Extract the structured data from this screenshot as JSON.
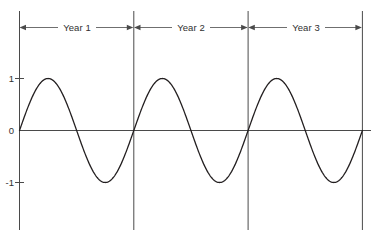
{
  "chart_data": {
    "type": "line",
    "title": "",
    "subtitle": "",
    "xlabel": "",
    "ylabel": "",
    "xlim": [
      0,
      3
    ],
    "ylim": [
      -1.35,
      1.35
    ],
    "grid": false,
    "legend": null,
    "x_tick_labels": [],
    "y_ticks": [
      1,
      0,
      -1
    ],
    "y_tick_labels": [
      "1",
      "0",
      "-1"
    ],
    "series": [
      {
        "name": "sine wave",
        "description": "y = sin(2*pi*x), three full cycles over three years",
        "color": "#231f20",
        "line_width": 1.3,
        "cycles": 3,
        "amplitude": 1,
        "period_years": 1,
        "x": [
          0,
          0.25,
          0.5,
          0.75,
          1,
          1.25,
          1.5,
          1.75,
          2,
          2.25,
          2.5,
          2.75,
          3
        ],
        "values": [
          0,
          1,
          0,
          -1,
          0,
          1,
          0,
          -1,
          0,
          1,
          0,
          -1,
          0
        ]
      }
    ],
    "annotations": [
      {
        "label": "Year 1",
        "x_start": 0,
        "x_end": 1,
        "style": "double-headed-arrow"
      },
      {
        "label": "Year 2",
        "x_start": 1,
        "x_end": 2,
        "style": "double-headed-arrow"
      },
      {
        "label": "Year 3",
        "x_start": 2,
        "x_end": 3,
        "style": "double-headed-arrow"
      }
    ],
    "dividers": [
      {
        "x": 0
      },
      {
        "x": 1
      },
      {
        "x": 2
      },
      {
        "x": 3
      }
    ],
    "colors": {
      "curve": "#231f20",
      "axis": "#4a4a4a",
      "divider": "#4a4a4a",
      "annotation": "#4a4a4a",
      "text": "#303030",
      "background": "#ffffff"
    }
  },
  "axis": {
    "y_labels": [
      {
        "text": "1"
      },
      {
        "text": "0"
      },
      {
        "text": "-1"
      }
    ]
  },
  "spans": [
    {
      "label": "Year 1"
    },
    {
      "label": "Year 2"
    },
    {
      "label": "Year 3"
    }
  ]
}
